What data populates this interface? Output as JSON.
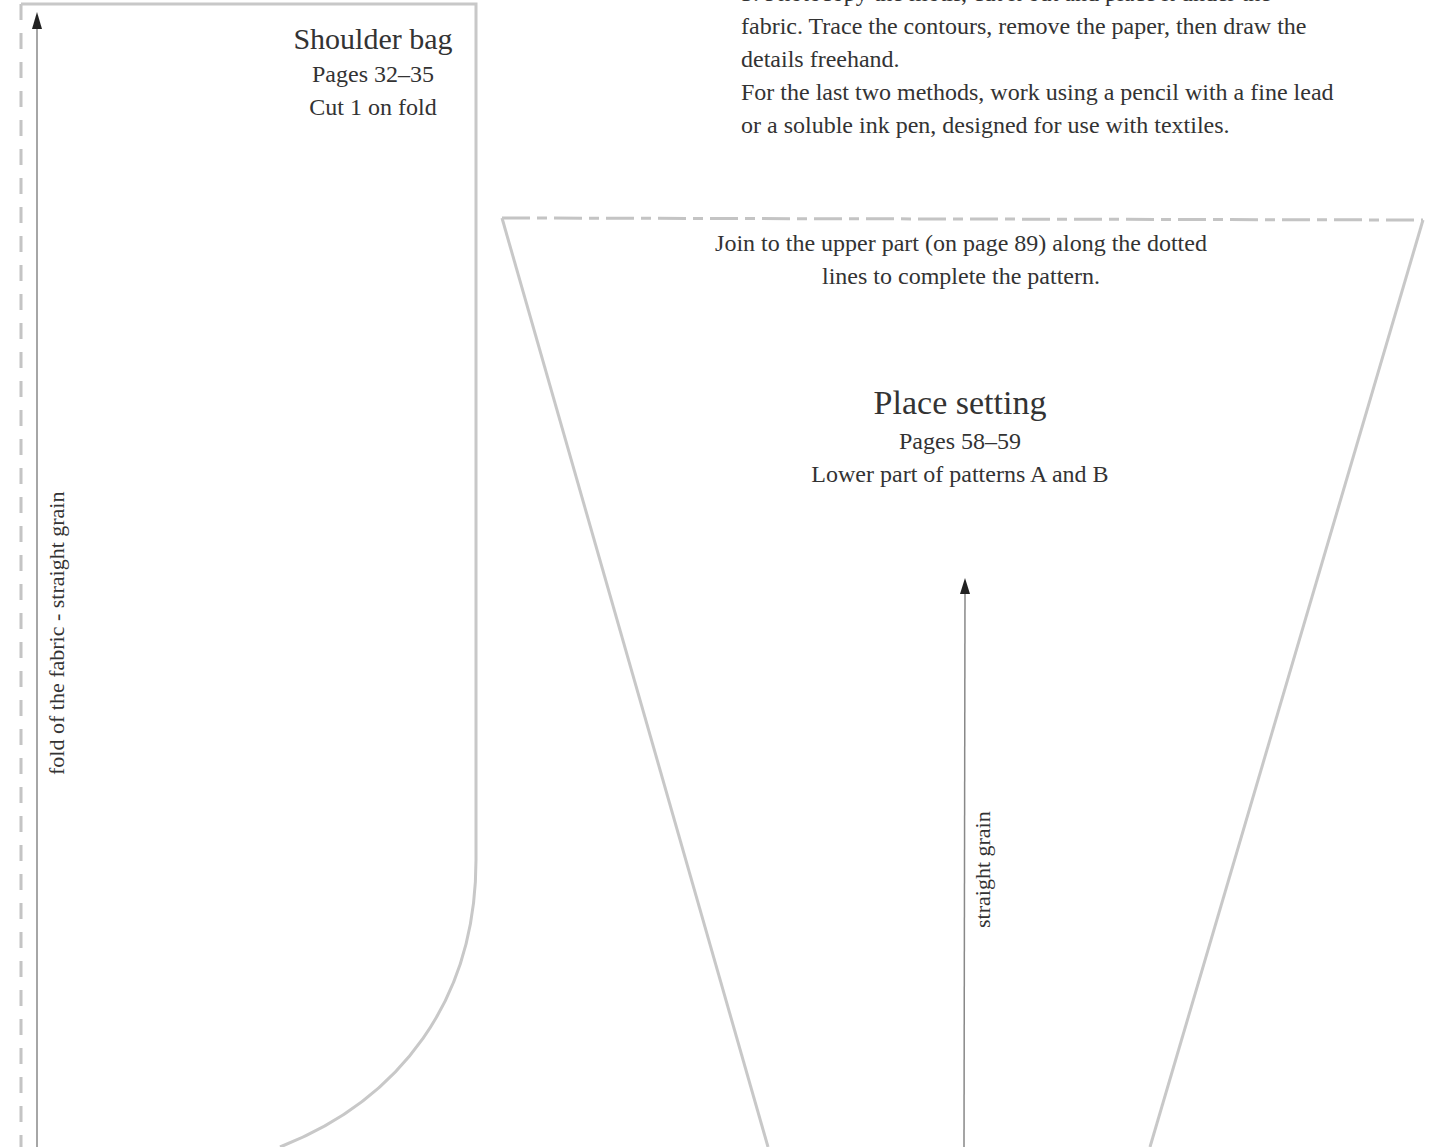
{
  "instructions": {
    "lines": [
      "3. Photocopy the motif, cut it out and place it under the",
      "fabric. Trace the contours, remove the paper, then draw the",
      "details freehand.",
      "For the last two methods, work using a pencil with a fine lead",
      "or a soluble ink pen, designed for use with textiles."
    ]
  },
  "shoulder_bag": {
    "title": "Shoulder bag",
    "pages": "Pages 32–35",
    "cut_note": "Cut 1 on fold",
    "fold_label": "fold of the fabric - straight grain",
    "outline_color": "#c8c8c8",
    "arrow_icon": "grain-arrow-up"
  },
  "place_setting": {
    "join_note_line1": "Join to the upper part (on page 89) along the dotted",
    "join_note_line2": "lines to complete the pattern.",
    "title": "Place setting",
    "pages": "Pages 58–59",
    "subtitle": "Lower part of patterns A and B",
    "grain_label": "straight grain",
    "outline_color": "#c8c8c8",
    "arrow_icon": "grain-arrow-up"
  },
  "colors": {
    "text": "#333333",
    "outline": "#c8c8c8",
    "arrow": "#777777",
    "arrowhead": "#222222"
  }
}
